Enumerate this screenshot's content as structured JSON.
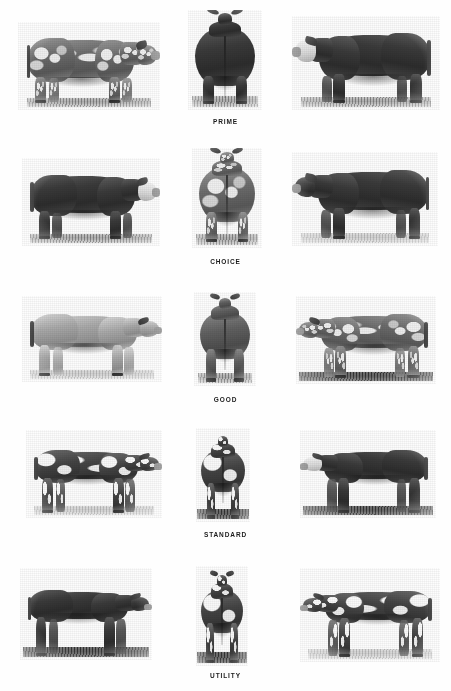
{
  "figure": {
    "kind": "beef-carcass-grade-plate",
    "background_color": "#fefefe",
    "text_color": "#1b1b1b",
    "width": 451,
    "height": 691,
    "columns": 3,
    "rows": 5
  },
  "grades": [
    {
      "label": "PRIME",
      "label_y": 118,
      "row_top": 14,
      "row_height": 100,
      "panels": [
        {
          "view": "side",
          "facing": "right",
          "coat": "roan",
          "condition": "very-heavy",
          "x": 18,
          "y": 22,
          "w": 142,
          "h": 88,
          "ground": "normal",
          "alt": "Heavily finished roan steer, side view facing right"
        },
        {
          "view": "rear",
          "horns": true,
          "coat": "dark",
          "condition": "very-heavy",
          "x": 188,
          "y": 10,
          "w": 74,
          "h": 100,
          "ground": "normal",
          "alt": "Heavily muscled steer, rear view with horns"
        },
        {
          "view": "side",
          "facing": "left",
          "coat": "hereford",
          "condition": "very-heavy",
          "x": 292,
          "y": 16,
          "w": 148,
          "h": 94,
          "ground": "normal",
          "alt": "Hereford type steer with white face, side view facing left"
        }
      ]
    },
    {
      "label": "CHOICE",
      "label_y": 258,
      "row_top": 152,
      "row_height": 100,
      "panels": [
        {
          "view": "side",
          "facing": "right",
          "coat": "hereford-dark",
          "condition": "heavy",
          "x": 22,
          "y": 158,
          "w": 138,
          "h": 88,
          "ground": "normal",
          "alt": "Choice grade steer, side view facing right"
        },
        {
          "view": "rear",
          "horns": true,
          "coat": "roan",
          "condition": "heavy",
          "x": 192,
          "y": 148,
          "w": 70,
          "h": 100,
          "ground": "normal",
          "alt": "Choice grade steer, rear view, speckled coat"
        },
        {
          "view": "side",
          "facing": "left",
          "coat": "dark",
          "condition": "heavy",
          "x": 292,
          "y": 152,
          "w": 146,
          "h": 94,
          "ground": "pale",
          "alt": "Choice grade dark steer, side view facing left"
        }
      ]
    },
    {
      "label": "GOOD",
      "label_y": 396,
      "row_top": 292,
      "row_height": 98,
      "panels": [
        {
          "view": "side",
          "facing": "right",
          "coat": "light",
          "condition": "moderate",
          "x": 22,
          "y": 296,
          "w": 140,
          "h": 86,
          "ground": "pale",
          "alt": "Good grade steer, side view facing right"
        },
        {
          "view": "rear",
          "horns": true,
          "coat": "mid",
          "condition": "moderate",
          "x": 194,
          "y": 292,
          "w": 62,
          "h": 94,
          "ground": "normal",
          "alt": "Good grade steer, rear view with horns"
        },
        {
          "view": "side",
          "facing": "left",
          "coat": "roan",
          "condition": "moderate",
          "x": 296,
          "y": 296,
          "w": 140,
          "h": 88,
          "ground": "dark",
          "alt": "Good grade roan steer, side view facing left"
        }
      ]
    },
    {
      "label": "STANDARD",
      "label_y": 531,
      "row_top": 428,
      "row_height": 98,
      "panels": [
        {
          "view": "side",
          "facing": "right",
          "coat": "pied",
          "condition": "thin",
          "x": 26,
          "y": 430,
          "w": 136,
          "h": 88,
          "ground": "pale",
          "alt": "Standard grade spotted steer, side view facing right"
        },
        {
          "view": "rear",
          "horns": false,
          "coat": "pied",
          "condition": "thin",
          "x": 196,
          "y": 428,
          "w": 54,
          "h": 94,
          "ground": "dark",
          "alt": "Standard grade steer, rear view"
        },
        {
          "view": "side",
          "facing": "left",
          "coat": "hereford",
          "condition": "thin",
          "x": 300,
          "y": 430,
          "w": 136,
          "h": 88,
          "ground": "dark",
          "alt": "Standard grade Hereford steer, side view facing left"
        }
      ]
    },
    {
      "label": "UTILITY",
      "label_y": 672,
      "row_top": 566,
      "row_height": 100,
      "panels": [
        {
          "view": "side",
          "facing": "right",
          "coat": "dark",
          "condition": "very-thin",
          "x": 20,
          "y": 568,
          "w": 132,
          "h": 92,
          "ground": "dark",
          "alt": "Utility grade dark steer, side view facing right"
        },
        {
          "view": "rear",
          "horns": true,
          "coat": "pied",
          "condition": "very-thin",
          "x": 196,
          "y": 566,
          "w": 52,
          "h": 100,
          "ground": "dark",
          "alt": "Utility grade steer, rear view with horns"
        },
        {
          "view": "side",
          "facing": "left",
          "coat": "pied",
          "condition": "very-thin",
          "x": 300,
          "y": 568,
          "w": 140,
          "h": 94,
          "ground": "pale",
          "alt": "Utility grade steer, side view facing left"
        }
      ]
    }
  ]
}
